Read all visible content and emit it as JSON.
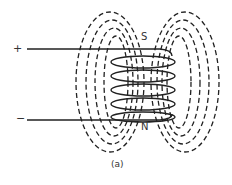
{
  "diagram": {
    "type": "solenoid-magnetic-field",
    "terminals": {
      "positive": "+",
      "negative": "−"
    },
    "poles": {
      "top": "S",
      "bottom": "N"
    },
    "caption": "(a)",
    "coil_turns": 5,
    "colors": {
      "line": "#222222",
      "text": "#333333",
      "background": "#ffffff"
    }
  }
}
